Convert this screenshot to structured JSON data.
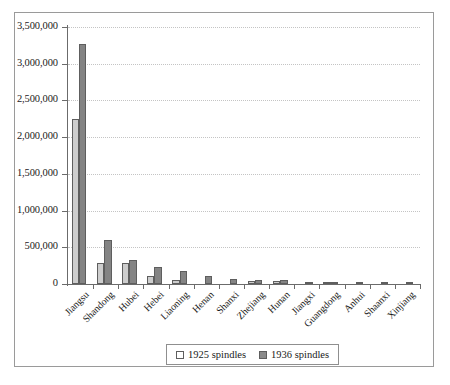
{
  "chart_data": {
    "type": "bar",
    "title": "",
    "subtitle": "",
    "xlabel": "",
    "ylabel": "",
    "grid": true,
    "legend_position": "bottom",
    "ylim": [
      0,
      3500000
    ],
    "ytick_labels": [
      "3,500,000",
      "3,000,000",
      "2,500,000",
      "2,000,000",
      "1,500,000",
      "1,000,000",
      "500,000",
      "0"
    ],
    "ytick_values": [
      3500000,
      3000000,
      2500000,
      2000000,
      1500000,
      1000000,
      500000,
      0
    ],
    "categories": [
      "Jiangsu",
      "Shandong",
      "Hubei",
      "Hebei",
      "Liaoning",
      "Henan",
      "Shanxi",
      "Zhejiang",
      "Hunan",
      "Jiangxi",
      "Guangdong",
      "Anhui",
      "Shaanxi",
      "Xinjiang"
    ],
    "series": [
      {
        "name": "1925 spindles",
        "color": "#cdcdcd",
        "values": [
          2250000,
          290000,
          280000,
          110000,
          60000,
          0,
          0,
          45000,
          45000,
          0,
          20000,
          0,
          0,
          0
        ]
      },
      {
        "name": "1936 spindles",
        "color": "#848484",
        "values": [
          3270000,
          600000,
          330000,
          230000,
          175000,
          110000,
          75000,
          55000,
          55000,
          25000,
          20000,
          18000,
          15000,
          10000
        ]
      }
    ]
  },
  "legend": {
    "entries": [
      {
        "label": "1925 spindles"
      },
      {
        "label": "1936 spindles"
      }
    ]
  }
}
